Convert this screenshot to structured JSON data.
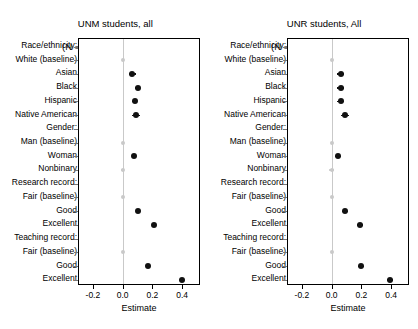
{
  "chart_data": {
    "type": "scatter",
    "layout": "two-panel dot (coefficient) plot, shared categories, grid off, zero reference line, no legend",
    "xlabel": "Estimate",
    "ylabel": "",
    "xlim": [
      -0.3,
      0.52
    ],
    "xticks": [
      -0.2,
      0.0,
      0.2,
      0.4
    ],
    "xticklabels": [
      "-0.2",
      "0.0",
      "0.2",
      "0.4"
    ],
    "zero_reference_line": 0.0,
    "categories": [
      "Race/ethnicity:",
      "White (baseline)",
      "Asian",
      "Black",
      "Hispanic",
      "Native American",
      "Gender:",
      "Man (baseline)",
      "Woman",
      "Nonbinary",
      "Research record:",
      "Fair (baseline)",
      "Good",
      "Excellent",
      "Teaching record:",
      "Fair (baseline)",
      "Good",
      "Excellent"
    ],
    "panels": [
      {
        "title_line1": "UNM students, all",
        "title_line2": "(N = 1,387)",
        "points": [
          {
            "label": "Race/ethnicity:",
            "is_header": true,
            "value": null
          },
          {
            "label": "White (baseline)",
            "is_baseline": true,
            "value": 0.0,
            "ci_low": 0.0,
            "ci_high": 0.0
          },
          {
            "label": "Asian",
            "value": 0.065,
            "ci_low": 0.04,
            "ci_high": 0.09
          },
          {
            "label": "Black",
            "value": 0.1,
            "ci_low": 0.08,
            "ci_high": 0.12
          },
          {
            "label": "Hispanic",
            "value": 0.08,
            "ci_low": 0.065,
            "ci_high": 0.095
          },
          {
            "label": "Native American",
            "value": 0.09,
            "ci_low": 0.06,
            "ci_high": 0.12
          },
          {
            "label": "Gender:",
            "is_header": true,
            "value": null
          },
          {
            "label": "Man (baseline)",
            "is_baseline": true,
            "value": 0.0,
            "ci_low": 0.0,
            "ci_high": 0.0
          },
          {
            "label": "Woman",
            "value": 0.075,
            "ci_low": 0.06,
            "ci_high": 0.09
          },
          {
            "label": "Nonbinary",
            "is_baseline": true,
            "value": 0.0,
            "ci_low": -0.01,
            "ci_high": 0.01
          },
          {
            "label": "Research record:",
            "is_header": true,
            "value": null
          },
          {
            "label": "Fair (baseline)",
            "is_baseline": true,
            "value": 0.0,
            "ci_low": 0.0,
            "ci_high": 0.0
          },
          {
            "label": "Good",
            "value": 0.105,
            "ci_low": 0.09,
            "ci_high": 0.12
          },
          {
            "label": "Excellent",
            "value": 0.21,
            "ci_low": 0.195,
            "ci_high": 0.225
          },
          {
            "label": "Teaching record:",
            "is_header": true,
            "value": null
          },
          {
            "label": "Fair (baseline)",
            "is_baseline": true,
            "value": 0.0,
            "ci_low": 0.0,
            "ci_high": 0.0
          },
          {
            "label": "Good",
            "value": 0.17,
            "ci_low": 0.155,
            "ci_high": 0.185
          },
          {
            "label": "Excellent",
            "value": 0.4,
            "ci_low": 0.385,
            "ci_high": 0.415
          }
        ]
      },
      {
        "title_line1": "UNR students, All",
        "title_line2": "(N = 622)",
        "points": [
          {
            "label": "Race/ethnicity:",
            "is_header": true,
            "value": null
          },
          {
            "label": "White (baseline)",
            "is_baseline": true,
            "value": 0.0,
            "ci_low": 0.0,
            "ci_high": 0.0
          },
          {
            "label": "Asian",
            "value": 0.06,
            "ci_low": 0.035,
            "ci_high": 0.085
          },
          {
            "label": "Black",
            "value": 0.06,
            "ci_low": 0.035,
            "ci_high": 0.085
          },
          {
            "label": "Hispanic",
            "value": 0.06,
            "ci_low": 0.035,
            "ci_high": 0.085
          },
          {
            "label": "Native American",
            "value": 0.09,
            "ci_low": 0.06,
            "ci_high": 0.12
          },
          {
            "label": "Gender:",
            "is_header": true,
            "value": null
          },
          {
            "label": "Man (baseline)",
            "is_baseline": true,
            "value": 0.0,
            "ci_low": 0.0,
            "ci_high": 0.0
          },
          {
            "label": "Woman",
            "value": 0.04,
            "ci_low": 0.02,
            "ci_high": 0.06
          },
          {
            "label": "Nonbinary",
            "is_baseline": true,
            "value": 0.0,
            "ci_low": -0.015,
            "ci_high": 0.015
          },
          {
            "label": "Research record:",
            "is_header": true,
            "value": null
          },
          {
            "label": "Fair (baseline)",
            "is_baseline": true,
            "value": 0.0,
            "ci_low": 0.0,
            "ci_high": 0.0
          },
          {
            "label": "Good",
            "value": 0.09,
            "ci_low": 0.07,
            "ci_high": 0.11
          },
          {
            "label": "Excellent",
            "value": 0.19,
            "ci_low": 0.17,
            "ci_high": 0.21
          },
          {
            "label": "Teaching record:",
            "is_header": true,
            "value": null
          },
          {
            "label": "Fair (baseline)",
            "is_baseline": true,
            "value": 0.0,
            "ci_low": 0.0,
            "ci_high": 0.0
          },
          {
            "label": "Good",
            "value": 0.2,
            "ci_low": 0.18,
            "ci_high": 0.22
          },
          {
            "label": "Excellent",
            "value": 0.395,
            "ci_low": 0.375,
            "ci_high": 0.415
          }
        ]
      }
    ],
    "colors": {
      "point": "#111111",
      "baseline_point": "#c9c9c9",
      "zero_line": "#c9c9c9",
      "axis": "#000000",
      "background": "#ffffff"
    }
  }
}
